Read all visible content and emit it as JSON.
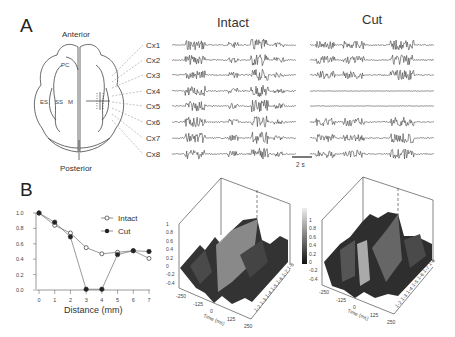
{
  "panel_a": {
    "letter": "A",
    "brain": {
      "anterior": "Anterior",
      "posterior": "Posterior",
      "regions": [
        "PC",
        "ES",
        "SS",
        "M"
      ]
    },
    "conditions": [
      "Intact",
      "Cut"
    ],
    "channels": [
      "Cx1",
      "Cx2",
      "Cx3",
      "Cx4",
      "Cx5",
      "Cx6",
      "Cx7",
      "Cx8"
    ],
    "scale_bar": "2 s"
  },
  "panel_b": {
    "letter": "B"
  },
  "chart_data": [
    {
      "type": "line",
      "title": "",
      "xlabel": "Distance (mm)",
      "ylabel": "",
      "x": [
        0,
        1,
        2,
        3,
        4,
        5,
        6,
        7
      ],
      "series": [
        {
          "name": "Intact",
          "marker": "open-circle",
          "values": [
            1.0,
            0.84,
            0.74,
            0.55,
            0.47,
            0.49,
            0.51,
            0.41
          ]
        },
        {
          "name": "Cut",
          "marker": "filled-circle",
          "values": [
            1.0,
            0.88,
            0.69,
            0.01,
            0.01,
            0.46,
            0.51,
            0.5
          ]
        }
      ],
      "yticks": [
        "0.0",
        "0.2",
        "0.4",
        "0.6",
        "0.8",
        "1.0"
      ],
      "xticks": [
        "0",
        "1",
        "2",
        "3",
        "4",
        "5",
        "6",
        "7"
      ],
      "ylim": [
        0,
        1.0
      ],
      "xlim": [
        0,
        7
      ],
      "legend_position": "upper-right"
    },
    {
      "type": "surface",
      "condition": "Intact",
      "xlabel": "Time (ms)",
      "xticks": [
        "-250",
        "-125",
        "0",
        "125",
        "250"
      ],
      "yticks": [
        "1-2",
        "1-3",
        "1-4",
        "1-5",
        "1-6",
        "1-7",
        "1-8"
      ],
      "zticks": [
        "-0.4",
        "-0.2",
        "0",
        "0.2",
        "0.4",
        "0.6",
        "0.8",
        "1"
      ],
      "zlim": [
        -0.4,
        1
      ]
    },
    {
      "type": "surface",
      "condition": "Cut",
      "xlabel": "Time (ms)",
      "xticks": [
        "-250",
        "-125",
        "0",
        "125",
        "250"
      ],
      "yticks": [
        "1-2",
        "1-3",
        "1-4",
        "1-5",
        "1-6",
        "1-7",
        "1-8"
      ],
      "zticks": [
        "-0.4",
        "-0.2",
        "0",
        "0.2",
        "0.4",
        "0.6",
        "0.8",
        "1"
      ],
      "zlim": [
        -0.4,
        1
      ],
      "colorbar_ticks": [
        "-0.4",
        "0",
        "0.2",
        "0.4",
        "0.6",
        "0.8",
        "1"
      ]
    }
  ]
}
